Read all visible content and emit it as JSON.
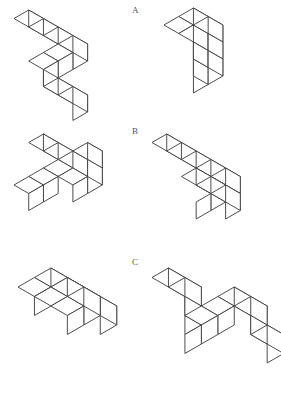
{
  "page": {
    "background_color": "#ffffff",
    "line_color": "#3a3a3a",
    "label_color": "#555555",
    "width": 281,
    "height": 405
  },
  "labels": {
    "a": "A",
    "b": "B",
    "c": "C"
  },
  "chart_data": {
    "type": "diagram",
    "rows": [
      {
        "label": "A",
        "label_position": {
          "x": 132,
          "y": 6
        },
        "figures": [
          {
            "name": "figure-a-left",
            "position": {
              "x": 12,
              "y": 8
            },
            "cube_size": 17,
            "cubes": [
              [
                0,
                0,
                0
              ],
              [
                1,
                0,
                0
              ],
              [
                2,
                0,
                0
              ],
              [
                3,
                0,
                0
              ],
              [
                3,
                1,
                0
              ],
              [
                3,
                2,
                0
              ],
              [
                3,
                2,
                -1
              ],
              [
                4,
                2,
                -1
              ],
              [
                5,
                2,
                -1
              ]
            ]
          },
          {
            "name": "figure-a-right",
            "position": {
              "x": 162,
              "y": 6
            },
            "cube_size": 17,
            "cubes": [
              [
                0,
                0,
                0
              ],
              [
                0,
                0,
                1
              ],
              [
                0,
                0,
                2
              ],
              [
                0,
                0,
                3
              ],
              [
                0,
                1,
                3
              ],
              [
                1,
                1,
                3
              ],
              [
                1,
                1,
                2
              ],
              [
                2,
                1,
                2
              ],
              [
                2,
                1,
                3
              ],
              [
                2,
                1,
                4
              ]
            ]
          }
        ]
      },
      {
        "label": "B",
        "label_position": {
          "x": 132,
          "y": 127
        },
        "figures": [
          {
            "name": "figure-b-left",
            "position": {
              "x": 12,
              "y": 132
            },
            "cube_size": 17,
            "cubes": [
              [
                0,
                0,
                0
              ],
              [
                1,
                0,
                0
              ],
              [
                2,
                0,
                0
              ],
              [
                3,
                0,
                0
              ],
              [
                3,
                0,
                1
              ],
              [
                3,
                1,
                0
              ],
              [
                2,
                1,
                0
              ],
              [
                2,
                2,
                0
              ],
              [
                2,
                3,
                0
              ]
            ]
          },
          {
            "name": "figure-b-right",
            "position": {
              "x": 150,
              "y": 132
            },
            "cube_size": 17,
            "cubes": [
              [
                0,
                0,
                0
              ],
              [
                1,
                0,
                0
              ],
              [
                2,
                0,
                0
              ],
              [
                3,
                0,
                0
              ],
              [
                4,
                0,
                0
              ],
              [
                4,
                1,
                0
              ],
              [
                4,
                2,
                0
              ],
              [
                4,
                2,
                1
              ],
              [
                5,
                2,
                1
              ],
              [
                6,
                2,
                1
              ]
            ]
          }
        ]
      },
      {
        "label": "C",
        "label_position": {
          "x": 132,
          "y": 258
        },
        "figures": [
          {
            "name": "figure-c-left",
            "position": {
              "x": 16,
              "y": 266
            },
            "cube_size": 19,
            "cubes": [
              [
                0,
                0,
                0
              ],
              [
                1,
                0,
                0
              ],
              [
                2,
                0,
                0
              ],
              [
                3,
                0,
                0
              ],
              [
                0,
                1,
                0
              ],
              [
                2,
                1,
                1
              ],
              [
                3,
                1,
                1
              ],
              [
                2,
                2,
                1
              ],
              [
                3,
                2,
                1
              ]
            ]
          },
          {
            "name": "figure-c-right",
            "position": {
              "x": 150,
              "y": 266
            },
            "cube_size": 19,
            "cubes": [
              [
                0,
                3,
                2
              ],
              [
                1,
                3,
                2
              ],
              [
                1,
                3,
                1
              ],
              [
                1,
                3,
                0
              ],
              [
                1,
                2,
                0
              ],
              [
                1,
                1,
                0
              ],
              [
                1,
                0,
                0
              ],
              [
                2,
                0,
                0
              ],
              [
                2,
                0,
                -1
              ],
              [
                3,
                0,
                -1
              ]
            ]
          }
        ]
      }
    ]
  }
}
